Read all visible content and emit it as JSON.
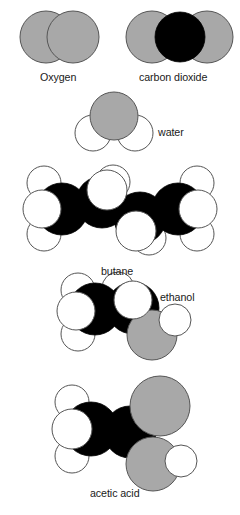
{
  "figure": {
    "background_color": "#ffffff",
    "atom_colors": {
      "oxygen_gray": "#a8a8a8",
      "carbon_black": "#000000",
      "hydrogen_white": "#ffffff",
      "outline": "#555555"
    }
  },
  "molecules": [
    {
      "id": "oxygen",
      "label": "Oxygen",
      "label_x": 40,
      "label_y": 71,
      "atoms": [
        {
          "element": "O",
          "color": "#a8a8a8",
          "cx": 46,
          "cy": 37,
          "r": 26
        },
        {
          "element": "O",
          "color": "#a8a8a8",
          "cx": 73,
          "cy": 37,
          "r": 26
        }
      ]
    },
    {
      "id": "carbon-dioxide",
      "label": "carbon dioxide",
      "label_x": 139,
      "label_y": 71,
      "atoms": [
        {
          "element": "O",
          "color": "#a8a8a8",
          "cx": 152,
          "cy": 37,
          "r": 26
        },
        {
          "element": "O",
          "color": "#a8a8a8",
          "cx": 207,
          "cy": 37,
          "r": 26
        },
        {
          "element": "C",
          "color": "#000000",
          "cx": 180,
          "cy": 37,
          "r": 25
        }
      ]
    },
    {
      "id": "water",
      "label": "water",
      "label_x": 158,
      "label_y": 126,
      "atoms": [
        {
          "element": "H",
          "color": "#ffffff",
          "cx": 93,
          "cy": 133,
          "r": 18
        },
        {
          "element": "H",
          "color": "#ffffff",
          "cx": 135,
          "cy": 133,
          "r": 18
        },
        {
          "element": "O",
          "color": "#a8a8a8",
          "cx": 114,
          "cy": 116,
          "r": 24
        }
      ]
    },
    {
      "id": "butane",
      "label": "butane",
      "label_x": 101,
      "label_y": 265,
      "atoms": [
        {
          "element": "H",
          "color": "#ffffff",
          "cx": 44,
          "cy": 183,
          "r": 17
        },
        {
          "element": "H",
          "color": "#ffffff",
          "cx": 44,
          "cy": 234,
          "r": 17
        },
        {
          "element": "H",
          "color": "#ffffff",
          "cx": 113,
          "cy": 182,
          "r": 17
        },
        {
          "element": "H",
          "color": "#ffffff",
          "cx": 149,
          "cy": 238,
          "r": 17
        },
        {
          "element": "H",
          "color": "#ffffff",
          "cx": 197,
          "cy": 183,
          "r": 17
        },
        {
          "element": "H",
          "color": "#ffffff",
          "cx": 197,
          "cy": 234,
          "r": 17
        },
        {
          "element": "C",
          "color": "#000000",
          "cx": 62,
          "cy": 209,
          "r": 26
        },
        {
          "element": "C",
          "color": "#000000",
          "cx": 178,
          "cy": 209,
          "r": 26
        },
        {
          "element": "C",
          "color": "#000000",
          "cx": 102,
          "cy": 202,
          "r": 26
        },
        {
          "element": "C",
          "color": "#000000",
          "cx": 140,
          "cy": 218,
          "r": 26
        },
        {
          "element": "H",
          "color": "#ffffff",
          "cx": 42,
          "cy": 209,
          "r": 19
        },
        {
          "element": "H",
          "color": "#ffffff",
          "cx": 198,
          "cy": 209,
          "r": 19
        },
        {
          "element": "H",
          "color": "#ffffff",
          "cx": 107,
          "cy": 190,
          "r": 20
        },
        {
          "element": "H",
          "color": "#ffffff",
          "cx": 136,
          "cy": 231,
          "r": 20
        }
      ]
    },
    {
      "id": "ethanol",
      "label": "ethanol",
      "label_x": 160,
      "label_y": 291,
      "atoms": [
        {
          "element": "H",
          "color": "#ffffff",
          "cx": 78,
          "cy": 290,
          "r": 17
        },
        {
          "element": "H",
          "color": "#ffffff",
          "cx": 78,
          "cy": 334,
          "r": 17
        },
        {
          "element": "H",
          "color": "#ffffff",
          "cx": 118,
          "cy": 288,
          "r": 16
        },
        {
          "element": "C",
          "color": "#000000",
          "cx": 95,
          "cy": 309,
          "r": 26
        },
        {
          "element": "C",
          "color": "#000000",
          "cx": 133,
          "cy": 308,
          "r": 26
        },
        {
          "element": "O",
          "color": "#a8a8a8",
          "cx": 152,
          "cy": 335,
          "r": 25
        },
        {
          "element": "H",
          "color": "#ffffff",
          "cx": 175,
          "cy": 320,
          "r": 16
        },
        {
          "element": "H",
          "color": "#ffffff",
          "cx": 76,
          "cy": 311,
          "r": 19
        },
        {
          "element": "H",
          "color": "#ffffff",
          "cx": 133,
          "cy": 300,
          "r": 19
        }
      ]
    },
    {
      "id": "acetic-acid",
      "label": "acetic acid",
      "label_x": 90,
      "label_y": 487,
      "atoms": [
        {
          "element": "H",
          "color": "#ffffff",
          "cx": 72,
          "cy": 402,
          "r": 17
        },
        {
          "element": "H",
          "color": "#ffffff",
          "cx": 72,
          "cy": 456,
          "r": 17
        },
        {
          "element": "C",
          "color": "#000000",
          "cx": 91,
          "cy": 429,
          "r": 27
        },
        {
          "element": "C",
          "color": "#000000",
          "cx": 130,
          "cy": 432,
          "r": 26
        },
        {
          "element": "O",
          "color": "#a8a8a8",
          "cx": 160,
          "cy": 406,
          "r": 30
        },
        {
          "element": "O",
          "color": "#a8a8a8",
          "cx": 153,
          "cy": 464,
          "r": 27
        },
        {
          "element": "H",
          "color": "#ffffff",
          "cx": 181,
          "cy": 461,
          "r": 16
        },
        {
          "element": "H",
          "color": "#ffffff",
          "cx": 72,
          "cy": 429,
          "r": 20
        }
      ]
    }
  ]
}
